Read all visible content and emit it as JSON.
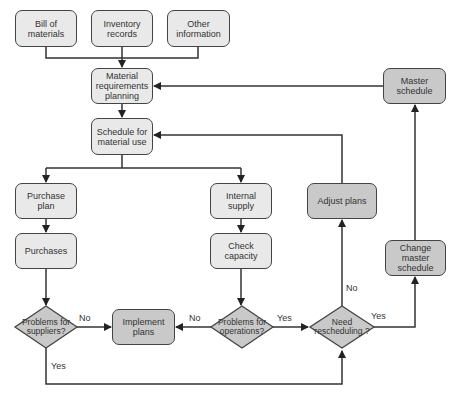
{
  "diagram": {
    "title": "",
    "colors": {
      "light_box": "#e9e9e9",
      "dark_box": "#c9c9c9",
      "line": "#333333"
    },
    "nodes": {
      "bill_of_materials": "Bill of materials",
      "inventory_records": "Inventory records",
      "other_information": "Other information",
      "mrp": "Material requirements planning",
      "schedule_material_use": "Schedule for material use",
      "purchase_plan": "Purchase plan",
      "purchases": "Purchases",
      "internal_supply": "Internal supply",
      "check_capacity": "Check capacity",
      "adjust_plans": "Adjust plans",
      "master_schedule": "Master schedule",
      "change_master_schedule": "Change master schedule",
      "implement_plans": "Implement plans",
      "problems_suppliers": "Problems for suppliers?",
      "problems_operations": "Problems for operations?",
      "need_rescheduling": "Need rescheduling ?"
    },
    "edge_labels": {
      "suppliers_no": "No",
      "suppliers_yes": "Yes",
      "operations_no": "No",
      "operations_yes": "Yes",
      "rescheduling_no": "No",
      "rescheduling_yes": "Yes"
    },
    "edges": [
      [
        "bill_of_materials",
        "mrp"
      ],
      [
        "inventory_records",
        "mrp"
      ],
      [
        "other_information",
        "mrp"
      ],
      [
        "mrp",
        "schedule_material_use"
      ],
      [
        "schedule_material_use",
        "purchase_plan"
      ],
      [
        "schedule_material_use",
        "internal_supply"
      ],
      [
        "purchase_plan",
        "purchases"
      ],
      [
        "purchases",
        "problems_suppliers"
      ],
      [
        "internal_supply",
        "check_capacity"
      ],
      [
        "check_capacity",
        "problems_operations"
      ],
      [
        "problems_suppliers",
        "implement_plans",
        "No"
      ],
      [
        "problems_suppliers",
        "need_rescheduling",
        "Yes"
      ],
      [
        "problems_operations",
        "implement_plans",
        "No"
      ],
      [
        "problems_operations",
        "need_rescheduling",
        "Yes"
      ],
      [
        "need_rescheduling",
        "adjust_plans",
        "No"
      ],
      [
        "need_rescheduling",
        "change_master_schedule",
        "Yes"
      ],
      [
        "adjust_plans",
        "schedule_material_use"
      ],
      [
        "change_master_schedule",
        "master_schedule"
      ],
      [
        "master_schedule",
        "mrp"
      ]
    ]
  }
}
